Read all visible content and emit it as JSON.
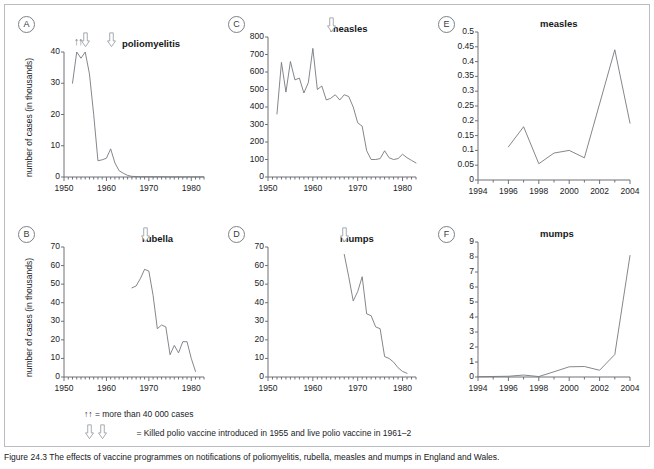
{
  "figure": {
    "legend_line1_symbol": "↑↑",
    "legend_line1_text": "= more than 40 000 cases",
    "legend_line2_text": "= Killed polio vaccine introduced in 1955 and live polio vaccine in 1961–2",
    "caption": "Figure 24.3  The effects of vaccine programmes on notifications of poliomyelitis, rubella, measles and mumps in England and Wales."
  },
  "chart_data": [
    {
      "id": "A",
      "panel_letter": "A",
      "type": "line",
      "title": "poliomyelitis",
      "xlabel": "",
      "ylabel": "number of cases (in thousands)",
      "xlim": [
        1950,
        1983
      ],
      "ylim": [
        0,
        40
      ],
      "yticks": [
        0,
        10,
        20,
        30,
        40
      ],
      "xticks": [
        1950,
        1960,
        1970,
        1980
      ],
      "grid": false,
      "markers": {
        "up_arrows": [
          1953,
          1954
        ],
        "down_arrows": [
          1955,
          1961
        ]
      },
      "x": [
        1952,
        1953,
        1954,
        1955,
        1956,
        1957,
        1958,
        1959,
        1960,
        1961,
        1962,
        1963,
        1964,
        1965,
        1966,
        1967,
        1968,
        1970,
        1972,
        1975,
        1978,
        1980,
        1983
      ],
      "values": [
        30,
        40,
        38,
        40,
        33,
        20,
        5.2,
        5.5,
        6.0,
        9.0,
        4.5,
        2.0,
        1.2,
        0.5,
        0.2,
        0.15,
        0.1,
        0.1,
        0.1,
        0.05,
        0.05,
        0.05,
        0.05
      ]
    },
    {
      "id": "B",
      "panel_letter": "B",
      "type": "line",
      "title": "rubella",
      "xlabel": "",
      "ylabel": "number of cases (in thousands)",
      "xlim": [
        1950,
        1983
      ],
      "ylim": [
        0,
        70
      ],
      "yticks": [
        0,
        10,
        20,
        30,
        40,
        50,
        60,
        70
      ],
      "xticks": [
        1950,
        1960,
        1970,
        1980
      ],
      "grid": false,
      "markers": {
        "up_arrows": [],
        "down_arrows": [
          1969
        ]
      },
      "x": [
        1966,
        1967,
        1968,
        1969,
        1970,
        1971,
        1972,
        1973,
        1974,
        1975,
        1976,
        1977,
        1978,
        1979,
        1980,
        1981
      ],
      "values": [
        48,
        49,
        53,
        58,
        57,
        44,
        26,
        28,
        27,
        12,
        17,
        13,
        19,
        19,
        10,
        3
      ]
    },
    {
      "id": "C",
      "panel_letter": "C",
      "type": "line",
      "title": "measles",
      "xlabel": "",
      "ylabel": "",
      "xlim": [
        1950,
        1983
      ],
      "ylim": [
        0,
        800
      ],
      "yticks": [
        0,
        100,
        200,
        300,
        400,
        500,
        600,
        700,
        800
      ],
      "xticks": [
        1950,
        1960,
        1970,
        1980
      ],
      "grid": false,
      "markers": {
        "up_arrows": [],
        "down_arrows": [
          1964
        ]
      },
      "x": [
        1952,
        1953,
        1954,
        1955,
        1956,
        1957,
        1958,
        1959,
        1960,
        1961,
        1962,
        1963,
        1964,
        1965,
        1966,
        1967,
        1968,
        1969,
        1970,
        1971,
        1972,
        1973,
        1974,
        1975,
        1976,
        1977,
        1978,
        1979,
        1980,
        1981,
        1982,
        1983
      ],
      "values": [
        360,
        655,
        485,
        660,
        555,
        565,
        480,
        540,
        735,
        500,
        520,
        440,
        450,
        470,
        440,
        470,
        460,
        400,
        310,
        290,
        150,
        100,
        100,
        105,
        150,
        110,
        100,
        105,
        130,
        110,
        95,
        80
      ]
    },
    {
      "id": "D",
      "panel_letter": "D",
      "type": "line",
      "title": "mumps",
      "xlabel": "",
      "ylabel": "",
      "xlim": [
        1950,
        1983
      ],
      "ylim": [
        0,
        70
      ],
      "yticks": [
        0,
        10,
        20,
        30,
        40,
        50,
        60,
        70
      ],
      "xticks": [
        1950,
        1960,
        1970,
        1980
      ],
      "grid": false,
      "markers": {
        "up_arrows": [],
        "down_arrows": [
          1967
        ]
      },
      "x": [
        1967,
        1968,
        1969,
        1970,
        1971,
        1972,
        1973,
        1974,
        1975,
        1976,
        1977,
        1978,
        1979,
        1980,
        1981
      ],
      "values": [
        66,
        54,
        41,
        46,
        54,
        34,
        33,
        27,
        26,
        11,
        10,
        8,
        5,
        3,
        2
      ]
    },
    {
      "id": "E",
      "panel_letter": "E",
      "type": "line",
      "title": "measles",
      "xlabel": "",
      "ylabel": "",
      "xlim": [
        1994,
        2004
      ],
      "ylim": [
        0,
        0.5
      ],
      "yticks": [
        0,
        0.05,
        0.1,
        0.15,
        0.2,
        0.25,
        0.3,
        0.35,
        0.4,
        0.45,
        0.5
      ],
      "ytick_labels": [
        "0",
        "0.05",
        "0.1",
        "0.15",
        "0.2",
        "0.25",
        "0.3",
        "0.35",
        "0.4",
        "0.45",
        "0.5"
      ],
      "xticks": [
        1994,
        1996,
        1998,
        2000,
        2002,
        2004
      ],
      "grid": false,
      "markers": {
        "up_arrows": [],
        "down_arrows": []
      },
      "x": [
        1996,
        1997,
        1998,
        1999,
        2000,
        2001,
        2003,
        2004
      ],
      "values": [
        0.112,
        0.18,
        0.055,
        0.091,
        0.1,
        0.075,
        0.44,
        0.192
      ]
    },
    {
      "id": "F",
      "panel_letter": "F",
      "type": "line",
      "title": "mumps",
      "xlabel": "",
      "ylabel": "",
      "xlim": [
        1994,
        2004
      ],
      "ylim": [
        0,
        9
      ],
      "yticks": [
        0,
        1,
        2,
        3,
        4,
        5,
        6,
        7,
        8,
        9
      ],
      "xticks": [
        1994,
        1996,
        1998,
        2000,
        2002,
        2004
      ],
      "grid": false,
      "markers": {
        "up_arrows": [],
        "down_arrows": []
      },
      "x": [
        1994,
        1996,
        1997,
        1998,
        1999,
        2000,
        2001,
        2002,
        2003,
        2004
      ],
      "values": [
        0.02,
        0.05,
        0.13,
        0.03,
        0.35,
        0.68,
        0.7,
        0.45,
        1.5,
        8.1
      ]
    }
  ]
}
